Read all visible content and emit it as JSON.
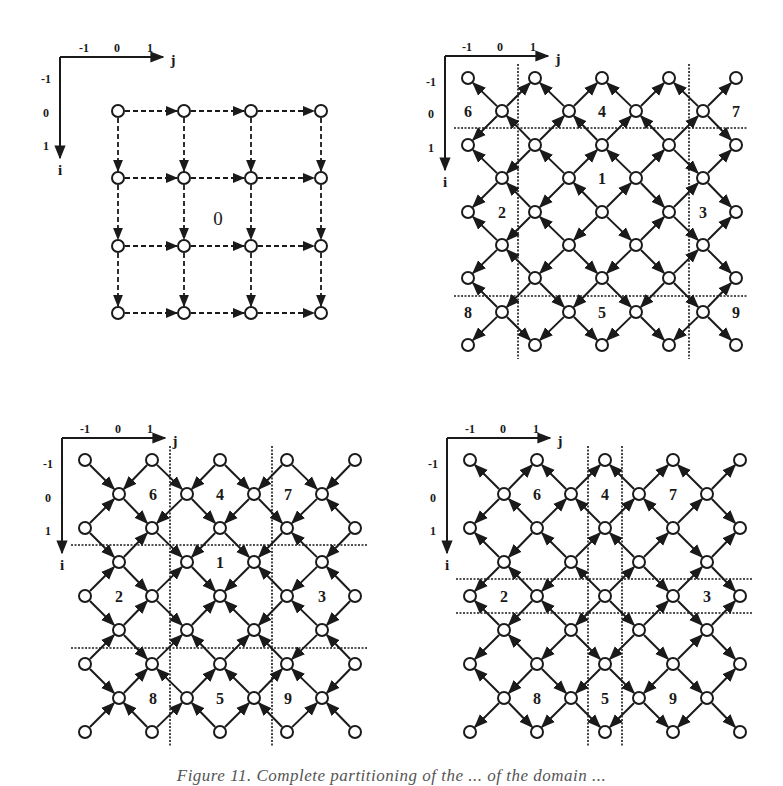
{
  "figure": {
    "caption": "Figure 11. Complete partitioning of the ... of the domain ...",
    "colors": {
      "ink": "#1a1a1a",
      "background": "#ffffff"
    },
    "panels": [
      {
        "id": "panel-a",
        "type": "square-grid",
        "axes": {
          "origin": [
            60,
            57
          ],
          "j_end": 163,
          "i_end": 158,
          "j_label": "j",
          "i_label": "i",
          "j_ticks": [
            {
              "label": "-1",
              "x": 84
            },
            {
              "label": "0",
              "x": 117
            },
            {
              "label": "1",
              "x": 150
            }
          ],
          "i_ticks": [
            {
              "label": "-1",
              "y": 79
            },
            {
              "label": "0",
              "y": 113
            },
            {
              "label": "1",
              "y": 146
            }
          ]
        },
        "nodes_x": [
          118,
          184,
          251,
          321
        ],
        "nodes_y": [
          111,
          178,
          246,
          313
        ],
        "edge_style": "dashed",
        "arrow_direction": "right-and-down",
        "regions": [
          {
            "label": "0",
            "x": 218,
            "y": 218
          }
        ],
        "partition_lines": {
          "vertical": [],
          "horizontal": []
        }
      },
      {
        "id": "panel-b",
        "type": "diamond-lattice",
        "axes": {
          "origin": [
            445,
            56
          ],
          "j_end": 548,
          "i_end": 170,
          "j_label": "j",
          "i_label": "i",
          "j_ticks": [
            {
              "label": "-1",
              "x": 467
            },
            {
              "label": "0",
              "x": 500
            },
            {
              "label": "1",
              "x": 533
            }
          ],
          "i_ticks": [
            {
              "label": "-1",
              "y": 82
            },
            {
              "label": "0",
              "y": 114
            },
            {
              "label": "1",
              "y": 148
            }
          ]
        },
        "wide_row_x": [
          468,
          535,
          602,
          669,
          736
        ],
        "narrow_row_x": [
          502,
          569,
          636,
          703
        ],
        "rows_y": [
          78,
          111,
          145,
          178,
          212,
          245,
          278,
          312,
          345
        ],
        "arrow_direction": "outward",
        "center": [
          602,
          212
        ],
        "regions": [
          {
            "label": "6",
            "x": 468,
            "y": 111
          },
          {
            "label": "4",
            "x": 602,
            "y": 111
          },
          {
            "label": "7",
            "x": 736,
            "y": 111
          },
          {
            "label": "1",
            "x": 602,
            "y": 178
          },
          {
            "label": "2",
            "x": 502,
            "y": 212
          },
          {
            "label": "3",
            "x": 703,
            "y": 212
          },
          {
            "label": "8",
            "x": 468,
            "y": 312
          },
          {
            "label": "5",
            "x": 602,
            "y": 312
          },
          {
            "label": "9",
            "x": 736,
            "y": 312
          }
        ],
        "partition_lines": {
          "vertical": [
            518,
            689
          ],
          "horizontal": [
            128,
            296
          ],
          "v_range": [
            65,
            360
          ],
          "h_range": [
            455,
            750
          ]
        }
      },
      {
        "id": "panel-c",
        "type": "diamond-lattice",
        "axes": {
          "origin": [
            62,
            438
          ],
          "j_end": 165,
          "i_end": 553,
          "j_label": "j",
          "i_label": "i",
          "j_ticks": [
            {
              "label": "-1",
              "x": 85
            },
            {
              "label": "0",
              "x": 118
            },
            {
              "label": "1",
              "x": 150
            }
          ],
          "i_ticks": [
            {
              "label": "-1",
              "y": 464
            },
            {
              "label": "0",
              "y": 498
            },
            {
              "label": "1",
              "y": 531
            }
          ]
        },
        "wide_row_x": [
          85,
          152,
          220,
          287,
          355
        ],
        "narrow_row_x": [
          119,
          187,
          254,
          322
        ],
        "rows_y": [
          460,
          494,
          528,
          562,
          596,
          630,
          664,
          698,
          732
        ],
        "arrow_direction": "inward",
        "center": [
          220,
          596
        ],
        "regions": [
          {
            "label": "6",
            "x": 153,
            "y": 494
          },
          {
            "label": "4",
            "x": 220,
            "y": 494
          },
          {
            "label": "7",
            "x": 288,
            "y": 494
          },
          {
            "label": "1",
            "x": 220,
            "y": 562
          },
          {
            "label": "2",
            "x": 119,
            "y": 596
          },
          {
            "label": "3",
            "x": 322,
            "y": 596
          },
          {
            "label": "8",
            "x": 153,
            "y": 698
          },
          {
            "label": "5",
            "x": 220,
            "y": 698
          },
          {
            "label": "9",
            "x": 288,
            "y": 698
          }
        ],
        "partition_lines": {
          "vertical": [
            170,
            272
          ],
          "horizontal": [
            545,
            648
          ],
          "v_range": [
            447,
            746
          ],
          "h_range": [
            73,
            372
          ]
        }
      },
      {
        "id": "panel-d",
        "type": "diamond-lattice",
        "axes": {
          "origin": [
            447,
            438
          ],
          "j_end": 550,
          "i_end": 553,
          "j_label": "j",
          "i_label": "i",
          "j_ticks": [
            {
              "label": "-1",
              "x": 470
            },
            {
              "label": "0",
              "x": 503
            },
            {
              "label": "1",
              "x": 536
            }
          ],
          "i_ticks": [
            {
              "label": "-1",
              "y": 464
            },
            {
              "label": "0",
              "y": 498
            },
            {
              "label": "1",
              "y": 531
            }
          ]
        },
        "wide_row_x": [
          470,
          537,
          605,
          673,
          740
        ],
        "narrow_row_x": [
          504,
          571,
          639,
          707
        ],
        "rows_y": [
          460,
          494,
          528,
          562,
          596,
          630,
          664,
          698,
          732
        ],
        "arrow_direction": "outward",
        "center": [
          605,
          596
        ],
        "regions": [
          {
            "label": "6",
            "x": 537,
            "y": 494
          },
          {
            "label": "4",
            "x": 605,
            "y": 494
          },
          {
            "label": "7",
            "x": 673,
            "y": 494
          },
          {
            "label": "2",
            "x": 504,
            "y": 596
          },
          {
            "label": "3",
            "x": 707,
            "y": 596
          },
          {
            "label": "8",
            "x": 537,
            "y": 698
          },
          {
            "label": "5",
            "x": 605,
            "y": 698
          },
          {
            "label": "9",
            "x": 673,
            "y": 698
          }
        ],
        "partition_lines": {
          "vertical": [
            588,
            622
          ],
          "horizontal": [
            579,
            613
          ],
          "v_range": [
            447,
            746
          ],
          "h_range": [
            458,
            752
          ]
        }
      }
    ]
  }
}
